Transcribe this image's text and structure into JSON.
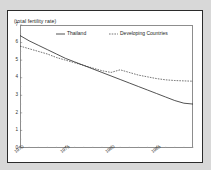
{
  "chart_data": {
    "type": "line",
    "title": "(total fertility rate)",
    "xlabel": "",
    "ylabel": "",
    "xlim": [
      1970,
      1989
    ],
    "ylim": [
      0,
      7
    ],
    "grid": false,
    "legend_position": "top-center-inside",
    "y_ticks": [
      "0",
      "1",
      "2",
      "3",
      "4",
      "5",
      "6",
      "7"
    ],
    "y_tick_values": [
      0,
      1,
      2,
      3,
      4,
      5,
      6,
      7
    ],
    "x_ticks": [
      "1970",
      "1975",
      "1980",
      "1985"
    ],
    "x_tick_values": [
      1970,
      1975,
      1980,
      1985
    ],
    "x": [
      1970,
      1971,
      1972,
      1973,
      1974,
      1975,
      1976,
      1977,
      1978,
      1979,
      1980,
      1981,
      1982,
      1983,
      1984,
      1985,
      1986,
      1987,
      1988,
      1989
    ],
    "series": [
      {
        "name": "Thailand",
        "style": "solid",
        "color": "#1a1a1a",
        "values": [
          6.4,
          6.1,
          5.85,
          5.6,
          5.35,
          5.1,
          4.9,
          4.7,
          4.5,
          4.3,
          4.1,
          3.9,
          3.7,
          3.5,
          3.3,
          3.1,
          2.9,
          2.7,
          2.55,
          2.5
        ]
      },
      {
        "name": "Developing Countries",
        "style": "dashed",
        "color": "#1a1a1a",
        "values": [
          5.8,
          5.65,
          5.5,
          5.35,
          5.15,
          5.0,
          4.85,
          4.7,
          4.55,
          4.4,
          4.3,
          4.45,
          4.3,
          4.15,
          4.05,
          3.95,
          3.88,
          3.84,
          3.82,
          3.8
        ]
      }
    ]
  },
  "legend": {
    "items": [
      {
        "label": "Thailand",
        "style": "solid"
      },
      {
        "label": "Developing Countries",
        "style": "dashed"
      }
    ]
  }
}
